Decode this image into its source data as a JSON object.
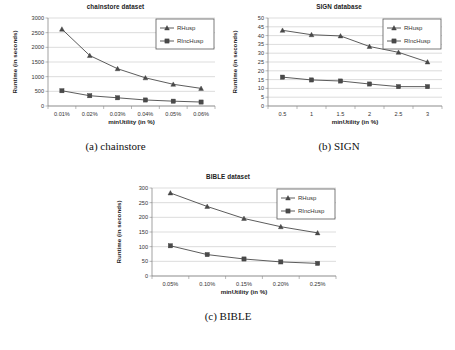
{
  "figure": {
    "panels": [
      {
        "id": "a",
        "caption": "(a) chainstore",
        "title": "chainstore dataset",
        "xlabel": "minUtility (in %)",
        "ylabel": "Runtime (in seconds)"
      },
      {
        "id": "b",
        "caption": "(b) SIGN",
        "title": "SIGN database",
        "xlabel": "minUtility (in %)",
        "ylabel": "Runtime (in seconds)"
      },
      {
        "id": "c",
        "caption": "(c) BIBLE",
        "title": "BIBLE dataset",
        "xlabel": "minUtility (in %)",
        "ylabel": "Runtime (in seconds)"
      }
    ]
  },
  "legend": {
    "rhusp_label": "RHusp",
    "rinchusp_label": "RIncHusp",
    "rhusp_marker": "triangle-marker",
    "rinchusp_marker": "square-marker"
  },
  "colors": {
    "line": "#4a4a4a",
    "grid": "#b9b9b9",
    "axis": "#7a7a7a",
    "background": "#ffffff",
    "text": "#333333"
  },
  "chart_data": [
    {
      "type": "line",
      "title": "chainstore dataset",
      "xlabel": "minUtility (in %)",
      "ylabel": "Runtime (in seconds)",
      "categories": [
        "0.01%",
        "0.02%",
        "0.03%",
        "0.04%",
        "0.05%",
        "0.06%"
      ],
      "yticks": [
        0,
        500,
        1000,
        1500,
        2000,
        2500,
        3000
      ],
      "ylim": [
        0,
        3000
      ],
      "grid": true,
      "legend_position": "top-right",
      "series": [
        {
          "name": "RHusp",
          "marker": "triangle",
          "values": [
            2620,
            1720,
            1270,
            960,
            740,
            600
          ]
        },
        {
          "name": "RIncHusp",
          "marker": "square",
          "values": [
            520,
            350,
            280,
            205,
            165,
            135
          ]
        }
      ]
    },
    {
      "type": "line",
      "title": "SIGN database",
      "xlabel": "minUtility (in %)",
      "ylabel": "Runtime (in seconds)",
      "categories": [
        "0.5",
        "1",
        "1.5",
        "2",
        "2.5",
        "3"
      ],
      "yticks": [
        0,
        5,
        10,
        15,
        20,
        25,
        30,
        35,
        40,
        45,
        50
      ],
      "ylim": [
        0,
        50
      ],
      "grid": true,
      "legend_position": "top-right",
      "series": [
        {
          "name": "RHusp",
          "marker": "triangle",
          "values": [
            43,
            40.5,
            39.8,
            33.8,
            30.5,
            25
          ]
        },
        {
          "name": "RIncHusp",
          "marker": "square",
          "values": [
            16.4,
            14.8,
            14.2,
            12.5,
            11,
            11
          ]
        }
      ]
    },
    {
      "type": "line",
      "title": "BIBLE dataset",
      "xlabel": "minUtility (in %)",
      "ylabel": "Runtime (in seconds)",
      "categories": [
        "0.05%",
        "0.10%",
        "0.15%",
        "0.20%",
        "0.25%"
      ],
      "yticks": [
        0,
        50,
        100,
        150,
        200,
        250,
        300
      ],
      "ylim": [
        0,
        300
      ],
      "grid": true,
      "legend_position": "top-right",
      "series": [
        {
          "name": "RHusp",
          "marker": "triangle",
          "values": [
            283,
            237,
            196,
            168,
            147
          ]
        },
        {
          "name": "RIncHusp",
          "marker": "square",
          "values": [
            103,
            73,
            58,
            48,
            43
          ]
        }
      ]
    }
  ]
}
